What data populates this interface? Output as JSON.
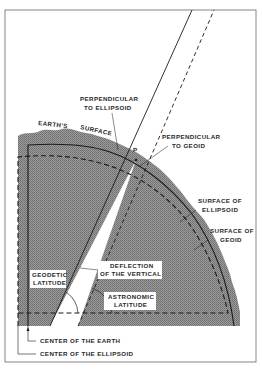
{
  "diagram": {
    "colors": {
      "background": "#ffffff",
      "frame": "#555555",
      "earth_fill": "#8a8a8a",
      "line": "#1a1a1a",
      "wedge": "#ffffff"
    },
    "labels": {
      "perp_ellipsoid_1": "PERPENDICULAR",
      "perp_ellipsoid_2": "TO ELLIPSOID",
      "earths": "EARTH'S",
      "surface": "SURFACE",
      "point_p": "P",
      "perp_geoid_1": "PERPENDICULAR",
      "perp_geoid_2": "TO GEOID",
      "surface_ellipsoid_1": "SURFACE OF",
      "surface_ellipsoid_2": "ELLIPSOID",
      "surface_geoid_1": "SURFACE OF",
      "surface_geoid_2": "GEOID",
      "deflection_1": "DEFLECTION",
      "deflection_2": "OF THE VERTICAL",
      "geodetic_1": "GEODETIC",
      "geodetic_2": "LATITUDE",
      "astronomic_1": "ASTRONOMIC",
      "astronomic_2": "LATITUDE",
      "center_earth": "CENTER OF THE EARTH",
      "center_ellipsoid": "CENTER OF THE ELLIPSOID"
    },
    "legend": {
      "solid_line": "ellipsoid / perpendicular to ellipsoid",
      "dashed_line": "geoid / perpendicular to geoid"
    }
  }
}
